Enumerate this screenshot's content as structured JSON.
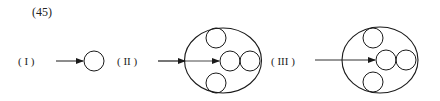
{
  "figure": {
    "number": "(45)"
  },
  "stages": [
    {
      "label": "( I )"
    },
    {
      "label": "( II )"
    },
    {
      "label": "( III )"
    }
  ],
  "colors": {
    "stroke": "#1a1a1a",
    "background": "#ffffff"
  }
}
